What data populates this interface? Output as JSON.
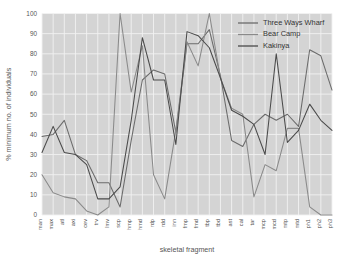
{
  "chart_data": {
    "type": "line",
    "title": "",
    "xlabel": "skeletal fragment",
    "ylabel": "% minimum no. of individuals",
    "ylim": [
      0,
      100
    ],
    "yticks": [
      0,
      10,
      20,
      30,
      40,
      50,
      60,
      70,
      80,
      90,
      100
    ],
    "grid": true,
    "legend_position": "top-right",
    "categories": [
      "man",
      "max",
      "atl",
      "axi",
      "cev",
      "trv",
      "lmv",
      "scp",
      "hmp",
      "hmd",
      "rdp",
      "rdd",
      "inn",
      "fmp",
      "fmd",
      "tbp",
      "tbd",
      "ast",
      "cal",
      "tar",
      "mcp",
      "mcd",
      "mtp",
      "mtd",
      "ph1",
      "ph2",
      "ph3"
    ],
    "series": [
      {
        "name": "Three Ways Wharf",
        "color": "#6b6b6b",
        "values": [
          39,
          40,
          47,
          30,
          27,
          16,
          16,
          4,
          37,
          67,
          72,
          70,
          41,
          85,
          85,
          92,
          69,
          37,
          34,
          45,
          50,
          47,
          50,
          44,
          82,
          79,
          62
        ]
      },
      {
        "name": "Bear Camp",
        "color": "#8a8a8a",
        "values": [
          20,
          11,
          9,
          8,
          2,
          0,
          4,
          100,
          61,
          84,
          20,
          8,
          42,
          86,
          74,
          100,
          68,
          53,
          50,
          9,
          25,
          22,
          43,
          43,
          4,
          0,
          0
        ]
      },
      {
        "name": "Kakinya",
        "color": "#4a4a4a",
        "values": [
          31,
          44,
          31,
          30,
          25,
          8,
          8,
          14,
          47,
          88,
          67,
          67,
          35,
          91,
          89,
          83,
          68,
          52,
          49,
          45,
          30,
          80,
          36,
          42,
          55,
          47,
          42
        ]
      }
    ]
  },
  "legend": {
    "entries": [
      {
        "label": "Three Ways Wharf"
      },
      {
        "label": "Bear Camp"
      },
      {
        "label": "Kakinya"
      }
    ]
  },
  "axes": {
    "x_title": "skeletal fragment",
    "y_title": "% minimum no. of individuals"
  },
  "style": {
    "plot_background": "#d4d4d4",
    "grid_color": "#f2f2f2",
    "figure_background": "#ffffff",
    "tick_text_color": "#555555"
  }
}
